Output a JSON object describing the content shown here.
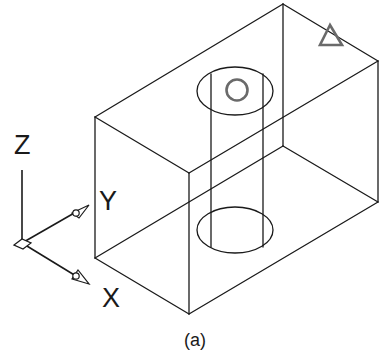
{
  "figure": {
    "caption": "(a)",
    "colors": {
      "line": "#1a1a1a",
      "marker": "#6a6a6a",
      "background": "#ffffff"
    }
  },
  "block": {
    "vertices": {
      "top_back": [
        283,
        4
      ],
      "top_right": [
        378,
        61
      ],
      "top_left": [
        95,
        117
      ],
      "top_front": [
        189,
        173
      ],
      "bottom_back": [
        283,
        146
      ],
      "bottom_right": [
        378,
        202
      ],
      "bottom_left": [
        95,
        258
      ],
      "bottom_front": [
        189,
        314
      ]
    }
  },
  "cylinder_hole": {
    "top_ellipse": {
      "cx": 235,
      "cy": 91,
      "rx": 38,
      "ry": 24
    },
    "bottom_ellipse": {
      "cx": 235,
      "cy": 230,
      "rx": 38,
      "ry": 23
    },
    "left_x": 211,
    "right_x": 263
  },
  "markers": {
    "circle": {
      "label": "circle-marker",
      "cx": 237,
      "cy": 90,
      "r": 11
    },
    "triangle": {
      "label": "triangle-marker",
      "points": "330,24 320,45 343,45"
    }
  },
  "axes": {
    "origin": [
      22,
      243
    ],
    "z": {
      "label": "Z",
      "end": [
        22,
        170
      ]
    },
    "y": {
      "label": "Y",
      "end": [
        89,
        205
      ]
    },
    "x": {
      "label": "X",
      "end": [
        89,
        283
      ]
    }
  }
}
